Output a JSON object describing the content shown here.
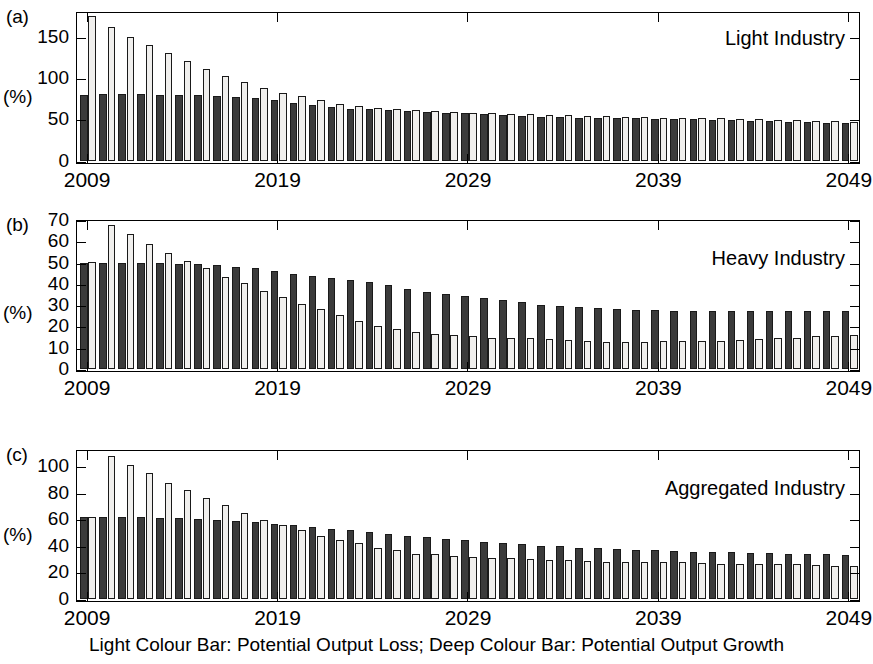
{
  "figure": {
    "caption": "Light Colour Bar: Potential Output Loss; Deep Colour Bar: Potential Output Growth",
    "axis_unit_label": "(%)",
    "deep_color": "#3b3b3b",
    "light_color": "#f0efed"
  },
  "panels": [
    {
      "tag": "(a)",
      "title": "Light Industry"
    },
    {
      "tag": "(b)",
      "title": "Heavy Industry"
    },
    {
      "tag": "(c)",
      "title": "Aggregated Industry"
    }
  ],
  "chart_data": [
    {
      "type": "bar",
      "panel": "(a)",
      "title": "Light Industry",
      "xlabel": "",
      "ylabel": "(%)",
      "ylim": [
        0,
        180
      ],
      "yticks": [
        0,
        50,
        100,
        150
      ],
      "xticks": [
        2009,
        2019,
        2029,
        2039,
        2049
      ],
      "grid": false,
      "legend": "Light Colour Bar: Potential Output Loss; Deep Colour Bar: Potential Output Growth",
      "categories": [
        2009,
        2010,
        2011,
        2012,
        2013,
        2014,
        2015,
        2016,
        2017,
        2018,
        2019,
        2020,
        2021,
        2022,
        2023,
        2024,
        2025,
        2026,
        2027,
        2028,
        2029,
        2030,
        2031,
        2032,
        2033,
        2034,
        2035,
        2036,
        2037,
        2038,
        2039,
        2040,
        2041,
        2042,
        2043,
        2044,
        2045,
        2046,
        2047,
        2048,
        2049
      ],
      "series": [
        {
          "name": "Potential Output Growth",
          "style": "deep",
          "values": [
            80,
            81,
            81,
            81,
            80,
            80,
            80,
            79,
            78,
            77,
            74,
            71,
            68,
            66,
            64,
            63,
            62,
            61,
            60,
            59,
            58,
            57,
            56,
            55,
            54,
            54,
            53,
            53,
            52,
            52,
            51,
            51,
            51,
            50,
            50,
            49,
            49,
            48,
            48,
            47,
            46
          ]
        },
        {
          "name": "Potential Output Loss",
          "style": "light",
          "values": [
            176,
            163,
            151,
            141,
            131,
            122,
            112,
            103,
            96,
            89,
            83,
            79,
            74,
            70,
            67,
            65,
            63,
            62,
            61,
            60,
            59,
            58,
            57,
            57,
            56,
            56,
            55,
            55,
            54,
            54,
            53,
            53,
            52,
            52,
            51,
            51,
            50,
            50,
            49,
            49,
            48
          ]
        }
      ]
    },
    {
      "type": "bar",
      "panel": "(b)",
      "title": "Heavy Industry",
      "xlabel": "",
      "ylabel": "(%)",
      "ylim": [
        0,
        70
      ],
      "yticks": [
        0,
        10,
        20,
        30,
        40,
        50,
        60,
        70
      ],
      "xticks": [
        2009,
        2019,
        2029,
        2039,
        2049
      ],
      "grid": false,
      "legend": "Light Colour Bar: Potential Output Loss; Deep Colour Bar: Potential Output Growth",
      "categories": [
        2009,
        2010,
        2011,
        2012,
        2013,
        2014,
        2015,
        2016,
        2017,
        2018,
        2019,
        2020,
        2021,
        2022,
        2023,
        2024,
        2025,
        2026,
        2027,
        2028,
        2029,
        2030,
        2031,
        2032,
        2033,
        2034,
        2035,
        2036,
        2037,
        2038,
        2039,
        2040,
        2041,
        2042,
        2043,
        2044,
        2045,
        2046,
        2047,
        2048,
        2049
      ],
      "series": [
        {
          "name": "Potential Output Growth",
          "style": "deep",
          "values": [
            50,
            50,
            50,
            50,
            50,
            49.5,
            49.5,
            49,
            48,
            47.5,
            46.5,
            45,
            44,
            43,
            42,
            41,
            39.5,
            38,
            36.5,
            35.5,
            34.5,
            33.5,
            32.5,
            31.5,
            30.5,
            30,
            29.5,
            29,
            28.5,
            28,
            28,
            27.5,
            27.5,
            27.5,
            27.5,
            27.5,
            27.5,
            27.5,
            27.5,
            27.5,
            27.5
          ]
        },
        {
          "name": "Potential Output Loss",
          "style": "light",
          "values": [
            50.5,
            68,
            63.5,
            59,
            55,
            51,
            47.5,
            43.5,
            40.5,
            37,
            34,
            31,
            28.5,
            25.5,
            23,
            20.5,
            19,
            17.5,
            16.5,
            16,
            15.5,
            15,
            15,
            15,
            14.5,
            14,
            13.5,
            13,
            13,
            13,
            13.5,
            13.5,
            13.5,
            13.5,
            14,
            14.5,
            15,
            15,
            15.5,
            15.5,
            16
          ]
        }
      ]
    },
    {
      "type": "bar",
      "panel": "(c)",
      "title": "Aggregated Industry",
      "xlabel": "",
      "ylabel": "(%)",
      "ylim": [
        0,
        112
      ],
      "yticks": [
        0,
        20,
        40,
        60,
        80,
        100
      ],
      "xticks": [
        2009,
        2019,
        2029,
        2039,
        2049
      ],
      "grid": false,
      "legend": "Light Colour Bar: Potential Output Loss; Deep Colour Bar: Potential Output Growth",
      "categories": [
        2009,
        2010,
        2011,
        2012,
        2013,
        2014,
        2015,
        2016,
        2017,
        2018,
        2019,
        2020,
        2021,
        2022,
        2023,
        2024,
        2025,
        2026,
        2027,
        2028,
        2029,
        2030,
        2031,
        2032,
        2033,
        2034,
        2035,
        2036,
        2037,
        2038,
        2039,
        2040,
        2041,
        2042,
        2043,
        2044,
        2045,
        2046,
        2047,
        2048,
        2049
      ],
      "series": [
        {
          "name": "Potential Output Growth",
          "style": "deep",
          "values": [
            62,
            62,
            62,
            62,
            61,
            61,
            60.5,
            60,
            59,
            58,
            57,
            56,
            54.5,
            53,
            52,
            50.5,
            49,
            48,
            47,
            45.5,
            44.5,
            43.5,
            42.5,
            41.5,
            40.5,
            40,
            39,
            38.5,
            38,
            37.5,
            37,
            36.5,
            36,
            35.5,
            35.5,
            35,
            35,
            34.5,
            34.5,
            34,
            33.5
          ]
        },
        {
          "name": "Potential Output Loss",
          "style": "light",
          "values": [
            62,
            108,
            101,
            95,
            88,
            82,
            76,
            71,
            65,
            60,
            56,
            52,
            48,
            45,
            42.5,
            39,
            37,
            34,
            34,
            32.5,
            32,
            31.5,
            31,
            30.5,
            30,
            29.5,
            29,
            28.5,
            28.5,
            28,
            28,
            28,
            27.5,
            27,
            27,
            27,
            26.5,
            26.5,
            26,
            25.5,
            25
          ]
        }
      ]
    }
  ]
}
